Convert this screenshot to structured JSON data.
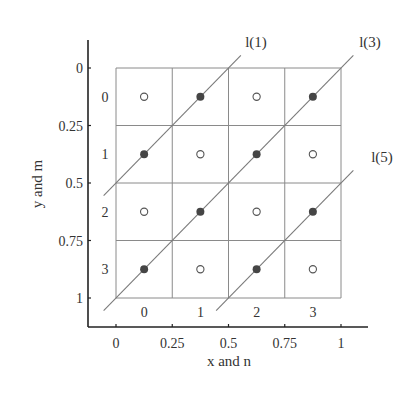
{
  "diagram": {
    "axes": {
      "x_label": "x and n",
      "y_label": "y and m",
      "x_ticks": [
        "0",
        "0.25",
        "0.5",
        "0.75",
        "1"
      ],
      "y_ticks": [
        "0",
        "0.25",
        "0.5",
        "0.75",
        "1"
      ],
      "col_labels": [
        "0",
        "1",
        "2",
        "3"
      ],
      "row_labels": [
        "0",
        "1",
        "2",
        "3"
      ]
    },
    "lines": [
      {
        "label": "l(1)",
        "sum": 0.5
      },
      {
        "label": "l(3)",
        "sum": 1.0
      },
      {
        "label": "l(5)",
        "sum": 1.5
      }
    ],
    "grid": {
      "cols": 4,
      "rows": 4
    },
    "cells": [
      [
        "open",
        "filled",
        "open",
        "filled"
      ],
      [
        "filled",
        "open",
        "filled",
        "open"
      ],
      [
        "open",
        "filled",
        "open",
        "filled"
      ],
      [
        "filled",
        "open",
        "filled",
        "open"
      ]
    ],
    "colors": {
      "line": "#777777",
      "grid": "#888888",
      "axis": "#222222",
      "dot": "#444444",
      "text": "#333333"
    }
  }
}
